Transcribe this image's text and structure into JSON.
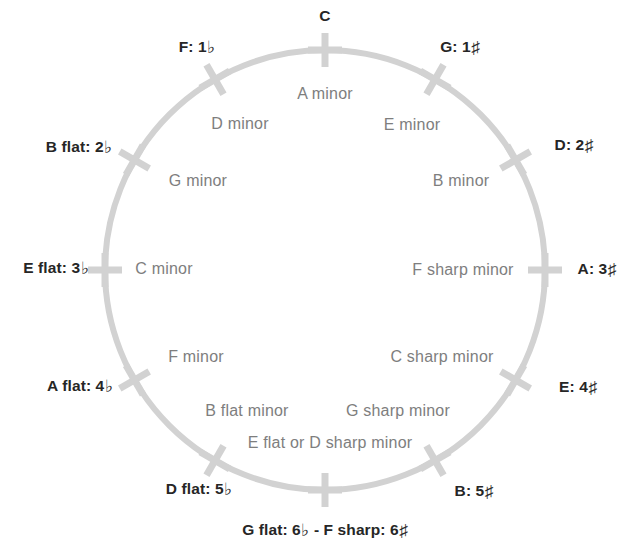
{
  "figure": {
    "kind": "circle-of-fifths",
    "circle": {
      "center_x": 325,
      "center_y": 270,
      "radius": 220,
      "stroke_color": "#d2d2d2",
      "stroke_width": 6,
      "tick_color": "#d2d2d2",
      "tick_length": 34,
      "tick_width": 7
    },
    "colors": {
      "major_text": "#262626",
      "minor_text": "#7e7e7e",
      "background": "#ffffff",
      "line": "#d2d2d2"
    },
    "symbols": {
      "flat": "♭",
      "sharp": "♯",
      "dash": "-"
    }
  },
  "positions": [
    {
      "key_index": 0,
      "angle_deg": 0,
      "major": {
        "name": "C",
        "accidental_count": 0,
        "accidental": "",
        "text": "C",
        "x": 325,
        "y": 16
      },
      "minor": {
        "text": "A minor",
        "x": 325,
        "y": 94
      }
    },
    {
      "key_index": 1,
      "angle_deg": 30,
      "major": {
        "name": "G",
        "accidental_count": 1,
        "accidental": "♯",
        "text": "G: 1♯",
        "x": 460,
        "y": 48
      },
      "minor": {
        "text": "E minor",
        "x": 412,
        "y": 125
      }
    },
    {
      "key_index": 2,
      "angle_deg": 60,
      "major": {
        "name": "D",
        "accidental_count": 2,
        "accidental": "♯",
        "text": "D: 2♯",
        "x": 574,
        "y": 146
      },
      "minor": {
        "text": "B minor",
        "x": 461,
        "y": 181
      }
    },
    {
      "key_index": 3,
      "angle_deg": 90,
      "major": {
        "name": "A",
        "accidental_count": 3,
        "accidental": "♯",
        "text": "A: 3♯",
        "x": 597,
        "y": 270
      },
      "minor": {
        "text": "F sharp minor",
        "x": 463,
        "y": 270
      }
    },
    {
      "key_index": 4,
      "angle_deg": 120,
      "major": {
        "name": "E",
        "accidental_count": 4,
        "accidental": "♯",
        "text": "E: 4♯",
        "x": 578,
        "y": 388
      },
      "minor": {
        "text": "C sharp minor",
        "x": 442,
        "y": 357
      }
    },
    {
      "key_index": 5,
      "angle_deg": 150,
      "major": {
        "name": "B",
        "accidental_count": 5,
        "accidental": "♯",
        "text": "B: 5♯",
        "x": 474,
        "y": 492
      },
      "minor": {
        "text": "G sharp minor",
        "x": 398,
        "y": 411
      }
    },
    {
      "key_index": 6,
      "angle_deg": 180,
      "major": {
        "name": "G flat / F sharp",
        "accidental_count": 6,
        "accidental": "both",
        "text": "G flat: 6♭ - F sharp: 6♯",
        "x": 325,
        "y": 531
      },
      "minor": {
        "text": "E flat or D sharp minor",
        "x": 330,
        "y": 443
      }
    },
    {
      "key_index": 7,
      "angle_deg": 210,
      "major": {
        "name": "D flat",
        "accidental_count": 5,
        "accidental": "♭",
        "text": "D flat: 5♭",
        "x": 199,
        "y": 490
      },
      "minor": {
        "text": "B flat minor",
        "x": 247,
        "y": 411
      }
    },
    {
      "key_index": 8,
      "angle_deg": 240,
      "major": {
        "name": "A flat",
        "accidental_count": 4,
        "accidental": "♭",
        "text": "A flat: 4♭",
        "x": 80,
        "y": 387
      },
      "minor": {
        "text": "F minor",
        "x": 196,
        "y": 357
      }
    },
    {
      "key_index": 9,
      "angle_deg": 270,
      "major": {
        "name": "E flat",
        "accidental_count": 3,
        "accidental": "♭",
        "text": "E flat: 3♭",
        "x": 56,
        "y": 269
      },
      "minor": {
        "text": "C minor",
        "x": 164,
        "y": 269
      }
    },
    {
      "key_index": 10,
      "angle_deg": 300,
      "major": {
        "name": "B flat",
        "accidental_count": 2,
        "accidental": "♭",
        "text": "B flat: 2♭",
        "x": 79,
        "y": 148
      },
      "minor": {
        "text": "G minor",
        "x": 198,
        "y": 181
      }
    },
    {
      "key_index": 11,
      "angle_deg": 330,
      "major": {
        "name": "F",
        "accidental_count": 1,
        "accidental": "♭",
        "text": "F: 1♭",
        "x": 197,
        "y": 48
      },
      "minor": {
        "text": "D minor",
        "x": 240,
        "y": 124
      }
    }
  ],
  "chart_data": {
    "type": "diagram",
    "major_keys": [
      "C",
      "G: 1♯",
      "D: 2♯",
      "A: 3♯",
      "E: 4♯",
      "B: 5♯",
      "G flat: 6♭ - F sharp: 6♯",
      "D flat: 5♭",
      "A flat: 4♭",
      "E flat: 3♭",
      "B flat: 2♭",
      "F: 1♭"
    ],
    "relative_minors": [
      "A minor",
      "E minor",
      "B minor",
      "F sharp minor",
      "C sharp minor",
      "G sharp minor",
      "E flat or D sharp minor",
      "B flat minor",
      "F minor",
      "C minor",
      "G minor",
      "D minor"
    ],
    "accidental_counts": [
      0,
      1,
      2,
      3,
      4,
      5,
      6,
      5,
      4,
      3,
      2,
      1
    ],
    "accidental_types": [
      "none",
      "sharp",
      "sharp",
      "sharp",
      "sharp",
      "sharp",
      "both",
      "flat",
      "flat",
      "flat",
      "flat",
      "flat"
    ],
    "angles_deg": [
      0,
      30,
      60,
      90,
      120,
      150,
      180,
      210,
      240,
      270,
      300,
      330
    ],
    "legend": [],
    "grid": false
  }
}
